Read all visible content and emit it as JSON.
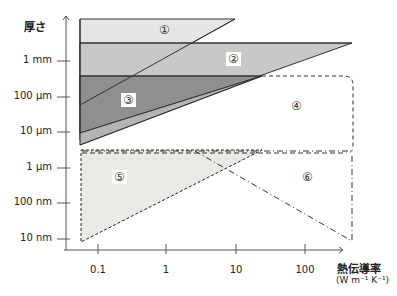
{
  "y_axis": {
    "title": "厚さ",
    "ticks": [
      "1 mm",
      "100 µm",
      "10 µm",
      "1 µm",
      "100 nm",
      "10 nm"
    ]
  },
  "x_axis": {
    "title": "熱伝導率",
    "unit": "(W m⁻¹ K⁻¹)",
    "ticks": [
      "0.1",
      "1",
      "10",
      "100"
    ]
  },
  "regions": [
    {
      "id": "1",
      "label": "①"
    },
    {
      "id": "2",
      "label": "②"
    },
    {
      "id": "3",
      "label": "③"
    },
    {
      "id": "4",
      "label": "④"
    },
    {
      "id": "5",
      "label": "⑤"
    },
    {
      "id": "6",
      "label": "⑥"
    }
  ],
  "colors": {
    "region1": "#e4e4e4",
    "region2": "#c9c9c9",
    "region3": "#8e8e8e",
    "region5": "#e8e8e8",
    "axis": "#555555"
  }
}
